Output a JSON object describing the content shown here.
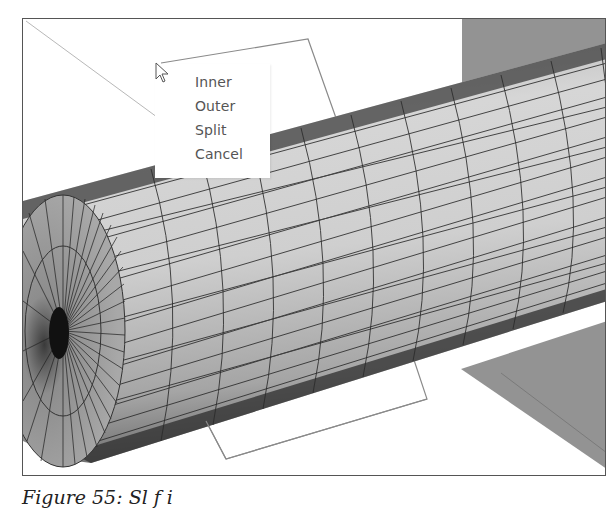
{
  "viewport": {
    "description": "3D CAD view of a meshed cylinder intersected by a cutting plane",
    "colors": {
      "background": "#ffffff",
      "cylinder_light": "#c9c9c9",
      "cylinder_dark": "#8a8a8a",
      "mesh_line": "#2b2b2b",
      "backplane": "#8f8f8f",
      "cut_plane_outline": "#8a8a8a",
      "frame_border": "#555555"
    }
  },
  "context_menu": {
    "items": [
      {
        "label": "Inner"
      },
      {
        "label": "Outer"
      },
      {
        "label": "Split"
      },
      {
        "label": "Cancel"
      }
    ]
  },
  "caption": {
    "text": "Figure 55: Sl                f      i"
  }
}
